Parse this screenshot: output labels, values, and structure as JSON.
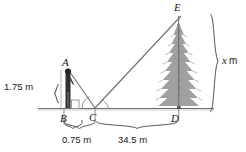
{
  "diagram": {
    "background_color": "#ffffff",
    "line_color": "#444444",
    "ground_color": "#555555",
    "tree_color": "#9a9a9a",
    "person_color": "#2b2b2b",
    "points": {
      "A": "A",
      "B": "B",
      "C": "C",
      "D": "D",
      "E": "E"
    },
    "measurements": {
      "person_height": "1.75 m",
      "bc_distance": "0.75 m",
      "cd_distance": "34.5 m",
      "unknown_height_value": "x",
      "unknown_height_unit": "m"
    }
  }
}
